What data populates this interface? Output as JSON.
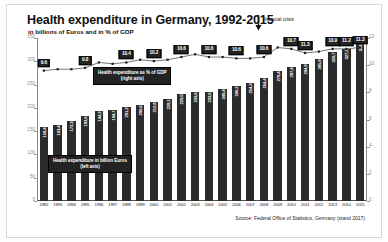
{
  "header": {
    "title": "Health expenditure in Germany, 1992-2015",
    "subtitle": "in billions of Euros and in % of GDP"
  },
  "legends": {
    "gdp_line_1": "Health expenditure as % of GDP",
    "gdp_line_2": "(right axis)",
    "bars_line_1": "Health expenditure in billion Euros",
    "bars_line_2": "(left axis)"
  },
  "annotation": {
    "crisis_label": "financial crisis",
    "crisis_icon": "down-arrow-icon"
  },
  "footer": {
    "source": "Source: Federal Office of Statistics, Germany (stand 2017)"
  },
  "axes": {
    "left_ticks": [
      "0",
      "50",
      "100",
      "150",
      "200",
      "250",
      "300",
      "350"
    ],
    "right_ticks": [
      "0",
      "2",
      "4",
      "6",
      "8",
      "10",
      "12"
    ]
  },
  "chart_data": {
    "type": "bar",
    "title": "Health expenditure in Germany, 1992-2015",
    "subtitle": "in billions of Euros and in % of GDP",
    "xlabel": "",
    "ylabel": "billion Euros",
    "y2label": "% of GDP",
    "ylim": [
      0,
      350
    ],
    "y2lim": [
      0,
      12
    ],
    "grid": false,
    "legend_position": "inside-chart",
    "categories": [
      "1992",
      "1993",
      "1994",
      "1995",
      "1996",
      "1997",
      "1998",
      "1999",
      "2000",
      "2001",
      "2002",
      "2003",
      "2004",
      "2005",
      "2006",
      "2007",
      "2008",
      "2009",
      "2010",
      "2011",
      "2012",
      "2013",
      "2014",
      "2015"
    ],
    "series": [
      {
        "name": "Health expenditure in billion Euros",
        "type": "bar",
        "axis": "left",
        "color": "#2b2b2b",
        "values": [
          158.4,
          163.4,
          172.3,
          183.6,
          194.2,
          194.7,
          201.2,
          206.6,
          212.8,
          220.1,
          229.0,
          233.6,
          233.6,
          240.4,
          246.2,
          254.3,
          264.4,
          278.4,
          287.4,
          294.9,
          305.8,
          320.7,
          327.2,
          344.2
        ]
      },
      {
        "name": "Health expenditure as % of GDP",
        "type": "line",
        "axis": "right",
        "color": "#3a3a3a",
        "values": [
          9.6,
          9.7,
          9.7,
          9.8,
          10.2,
          10.1,
          10.2,
          10.4,
          10.3,
          10.4,
          10.6,
          10.8,
          10.6,
          10.6,
          10.5,
          10.5,
          10.6,
          11.3,
          11.2,
          10.9,
          11.0,
          11.2,
          11.2,
          11.3
        ]
      }
    ],
    "gdp_point_labels": [
      {
        "index": 0,
        "text": "9.6"
      },
      {
        "index": 3,
        "text": "9.8"
      },
      {
        "index": 6,
        "text": "10.4"
      },
      {
        "index": 8,
        "text": "10.2"
      },
      {
        "index": 10,
        "text": "10.6"
      },
      {
        "index": 12,
        "text": "10.6"
      },
      {
        "index": 14,
        "text": "10.6"
      },
      {
        "index": 16,
        "text": "10.6"
      },
      {
        "index": 18,
        "text": "10.7"
      },
      {
        "index": 19,
        "text": "11.3"
      },
      {
        "index": 21,
        "text": "10.9"
      },
      {
        "index": 22,
        "text": "11.2"
      },
      {
        "index": 23,
        "text": "11.3"
      }
    ],
    "bar_value_labels": [
      "158,4",
      "163,4",
      "172,3",
      "183,6",
      "194,2",
      "194,7",
      "201,2",
      "206,6",
      "212,8",
      "220,1",
      "229,0",
      "233,6",
      "233,6",
      "240,4",
      "246,2",
      "254,3",
      "264,4",
      "278,4",
      "287,4",
      "294,9",
      "305,8",
      "320,7",
      "327,2",
      "344,2"
    ]
  }
}
